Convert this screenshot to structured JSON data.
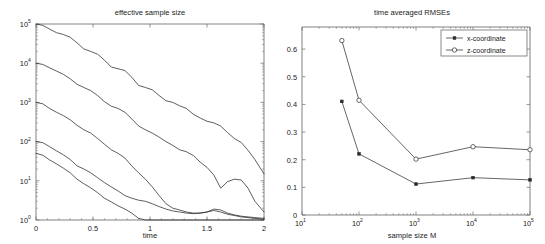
{
  "figure": {
    "width": 545,
    "height": 244,
    "background": "#ffffff",
    "ink_color": "#2a2a2a"
  },
  "chart_data": [
    {
      "id": "effective-sample-size",
      "type": "line",
      "title": "effective sample size",
      "xlabel": "time",
      "ylabel": "",
      "xscale": "linear",
      "yscale": "log",
      "xlim": [
        0,
        2
      ],
      "ylim": [
        1,
        100000
      ],
      "grid": false,
      "legend": null,
      "xticks": [
        0,
        0.5,
        1,
        1.5,
        2
      ],
      "xticklabels": [
        "0",
        "0.5",
        "1",
        "1.5",
        "2"
      ],
      "yticks": [
        1,
        10,
        100,
        1000,
        10000,
        100000
      ],
      "yticklabels": [
        "10^0",
        "10^1",
        "10^2",
        "10^3",
        "10^4",
        "10^5"
      ],
      "yticklabel_bases": [
        "10",
        "10",
        "10",
        "10",
        "10",
        "10"
      ],
      "yticklabel_exps": [
        "0",
        "1",
        "2",
        "3",
        "4",
        "5"
      ],
      "series": [
        {
          "name": "M = 100000",
          "start_value": 100000,
          "x": [
            0.0,
            0.06,
            0.12,
            0.18,
            0.24,
            0.3,
            0.36,
            0.42,
            0.48,
            0.54,
            0.6,
            0.66,
            0.72,
            0.78,
            0.84,
            0.9,
            0.96,
            1.02,
            1.08,
            1.14,
            1.2,
            1.26,
            1.32,
            1.38,
            1.44,
            1.5,
            1.56,
            1.62,
            1.68,
            1.74,
            1.8,
            1.86,
            1.92,
            2.0
          ],
          "y": [
            100000,
            92000,
            74000,
            60000,
            54000,
            46000,
            33000,
            23000,
            20000,
            17000,
            12000,
            8000,
            7200,
            6500,
            4400,
            2700,
            2400,
            2100,
            1500,
            1100,
            1000,
            820,
            700,
            500,
            400,
            330,
            300,
            250,
            170,
            120,
            95,
            60,
            35,
            15
          ]
        },
        {
          "name": "M = 10000",
          "start_value": 10000,
          "x": [
            0.0,
            0.06,
            0.12,
            0.18,
            0.24,
            0.3,
            0.36,
            0.42,
            0.48,
            0.54,
            0.6,
            0.66,
            0.72,
            0.78,
            0.84,
            0.9,
            0.96,
            1.02,
            1.08,
            1.14,
            1.2,
            1.26,
            1.32,
            1.38,
            1.44,
            1.5,
            1.56,
            1.62,
            1.68,
            1.74,
            1.8,
            1.86,
            1.92,
            2.0
          ],
          "y": [
            10000,
            9300,
            7600,
            6300,
            5200,
            4000,
            2900,
            2400,
            2000,
            1500,
            1050,
            800,
            700,
            560,
            380,
            250,
            200,
            165,
            130,
            100,
            80,
            62,
            55,
            44,
            30,
            22,
            14,
            6.5,
            9.5,
            11,
            10.5,
            6.5,
            3.0,
            1.6
          ]
        },
        {
          "name": "M = 1000",
          "start_value": 1000,
          "x": [
            0.0,
            0.06,
            0.12,
            0.18,
            0.24,
            0.3,
            0.36,
            0.42,
            0.48,
            0.54,
            0.6,
            0.66,
            0.72,
            0.78,
            0.84,
            0.9,
            0.96,
            1.02,
            1.08,
            1.14,
            1.2,
            1.26,
            1.32,
            1.38,
            1.44,
            1.5,
            1.56,
            1.62,
            1.68,
            1.74,
            1.8,
            1.86,
            1.92,
            2.0
          ],
          "y": [
            1000,
            920,
            700,
            560,
            460,
            360,
            260,
            200,
            165,
            120,
            86,
            62,
            50,
            38,
            24,
            16,
            11,
            7.0,
            4.2,
            2.6,
            2.0,
            1.8,
            1.6,
            1.5,
            1.5,
            1.6,
            1.9,
            1.8,
            1.5,
            1.35,
            1.25,
            1.2,
            1.15,
            1.1
          ]
        },
        {
          "name": "M = 100",
          "start_value": 100,
          "x": [
            0.0,
            0.06,
            0.12,
            0.18,
            0.24,
            0.3,
            0.36,
            0.42,
            0.48,
            0.54,
            0.6,
            0.66,
            0.72,
            0.78,
            0.84,
            0.9,
            0.96,
            1.02,
            1.08,
            1.14,
            1.2,
            1.26,
            1.32,
            1.38,
            1.44,
            1.5,
            1.56,
            1.62,
            1.68,
            1.74,
            1.8,
            1.86,
            1.92,
            2.0
          ],
          "y": [
            100,
            94,
            74,
            58,
            46,
            35,
            24,
            20,
            16,
            12,
            9.0,
            7.0,
            5.5,
            4.2,
            3.6,
            3.2,
            3.0,
            2.6,
            2.2,
            1.9,
            1.7,
            1.6,
            1.5,
            1.45,
            1.5,
            1.6,
            1.75,
            1.6,
            1.4,
            1.3,
            1.2,
            1.15,
            1.1,
            1.05
          ]
        },
        {
          "name": "M = 50",
          "start_value": 50,
          "x": [
            0.0,
            0.06,
            0.12,
            0.18,
            0.24,
            0.3,
            0.36,
            0.42,
            0.48,
            0.54,
            0.6,
            0.66,
            0.72,
            0.78,
            0.84,
            0.9,
            0.96,
            1.02,
            1.08,
            1.14,
            1.2,
            1.26,
            1.32,
            1.38,
            1.44,
            1.5,
            1.56,
            1.62,
            1.68,
            1.74,
            1.8,
            1.86,
            1.92,
            2.0
          ],
          "y": [
            50,
            45,
            34,
            27,
            21,
            16,
            11,
            8.4,
            6.6,
            5.0,
            3.6,
            2.9,
            2.3,
            1.9,
            1.5,
            1.1,
            1.0,
            1.0,
            1.0,
            1.0,
            1.0,
            1.0,
            1.0,
            1.0,
            1.0,
            1.0,
            1.0,
            1.0,
            1.0,
            1.0,
            1.0,
            1.0,
            1.0,
            1.0
          ]
        }
      ]
    },
    {
      "id": "time-averaged-rmses",
      "type": "line",
      "title": "time averaged RMSEs",
      "xlabel": "sample size M",
      "ylabel": "",
      "xscale": "log",
      "yscale": "linear",
      "xlim": [
        10,
        100000
      ],
      "ylim": [
        0,
        0.68
      ],
      "grid": false,
      "legend_position": "upper right",
      "xticks": [
        10,
        100,
        1000,
        10000,
        100000
      ],
      "xticklabels": [
        "10^1",
        "10^2",
        "10^3",
        "10^4",
        "10^5"
      ],
      "xticklabel_bases": [
        "10",
        "10",
        "10",
        "10",
        "10"
      ],
      "xticklabel_exps": [
        "1",
        "2",
        "3",
        "4",
        "5"
      ],
      "yticks": [
        0,
        0.1,
        0.2,
        0.3,
        0.4,
        0.5,
        0.6
      ],
      "yticklabels": [
        "0",
        "0.1",
        "0.2",
        "0.3",
        "0.4",
        "0.5",
        "0.6"
      ],
      "x": [
        50,
        100,
        1000,
        10000,
        100000
      ],
      "series": [
        {
          "name": "x-coordinate",
          "marker": "square",
          "values": [
            0.411,
            0.221,
            0.112,
            0.135,
            0.127
          ]
        },
        {
          "name": "z-coordinate",
          "marker": "circle",
          "values": [
            0.631,
            0.415,
            0.202,
            0.247,
            0.236
          ]
        }
      ]
    }
  ]
}
